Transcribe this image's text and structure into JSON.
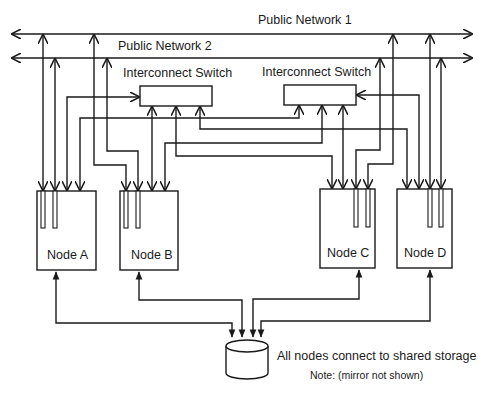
{
  "diagram": {
    "networks": {
      "public_network_1": "Public Network 1",
      "public_network_2": "Public Network 2"
    },
    "switches": {
      "left_label": "Interconnect Switch",
      "right_label": "Interconnect Switch"
    },
    "nodes": [
      {
        "id": "A",
        "label": "Node A"
      },
      {
        "id": "B",
        "label": "Node B"
      },
      {
        "id": "C",
        "label": "Node C"
      },
      {
        "id": "D",
        "label": "Node D"
      }
    ],
    "storage": {
      "label": "All nodes connect to shared storage",
      "note": "Note: (mirror not shown)",
      "icon": "database-cylinder-icon"
    },
    "colors": {
      "line": "#1a1a1a",
      "background": "#ffffff"
    }
  }
}
